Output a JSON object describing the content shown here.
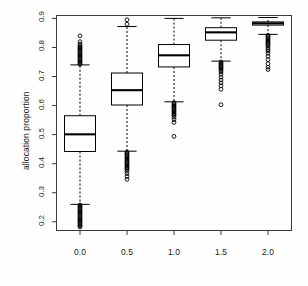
{
  "chart_data": {
    "type": "box",
    "title": "",
    "xlabel": "",
    "ylabel": "allocation proportion",
    "grid": false,
    "legend": null,
    "xlim": [
      -0.25,
      2.25
    ],
    "ylim": [
      0.17,
      0.91
    ],
    "x_tick_labels": [
      "0.0",
      "0.5",
      "1.0",
      "1.5",
      "2.0"
    ],
    "x_tick_values": [
      0.0,
      0.5,
      1.0,
      1.5,
      2.0
    ],
    "y_tick_labels": [
      "0.2",
      "0.3",
      "0.4",
      "0.5",
      "0.6",
      "0.7",
      "0.8",
      "0.9"
    ],
    "y_tick_values": [
      0.2,
      0.3,
      0.4,
      0.5,
      0.6,
      0.7,
      0.8,
      0.9
    ],
    "categories": [
      "0.0",
      "0.5",
      "1.0",
      "1.5",
      "2.0"
    ],
    "boxes": [
      {
        "category": "0.0",
        "x": 0.0,
        "q1": 0.442,
        "median": 0.501,
        "q3": 0.565,
        "whisker_low": 0.26,
        "whisker_high": 0.74,
        "outliers_low": [
          0.258,
          0.254,
          0.25,
          0.246,
          0.242,
          0.238,
          0.234,
          0.23,
          0.226,
          0.222,
          0.218,
          0.214,
          0.21,
          0.206,
          0.202,
          0.198,
          0.194,
          0.19,
          0.186,
          0.182
        ],
        "outliers_high": [
          0.742,
          0.746,
          0.75,
          0.754,
          0.758,
          0.762,
          0.766,
          0.77,
          0.774,
          0.778,
          0.782,
          0.786,
          0.79,
          0.794,
          0.798,
          0.802,
          0.806,
          0.812,
          0.82,
          0.84
        ]
      },
      {
        "category": "0.5",
        "x": 0.5,
        "q1": 0.602,
        "median": 0.653,
        "q3": 0.712,
        "whisker_low": 0.443,
        "whisker_high": 0.872,
        "outliers_low": [
          0.44,
          0.436,
          0.432,
          0.428,
          0.424,
          0.42,
          0.416,
          0.412,
          0.408,
          0.404,
          0.4,
          0.396,
          0.392,
          0.388,
          0.384,
          0.38,
          0.374,
          0.366,
          0.356,
          0.346
        ],
        "outliers_high": [
          0.88,
          0.895
        ]
      },
      {
        "category": "1.0",
        "x": 1.0,
        "q1": 0.733,
        "median": 0.773,
        "q3": 0.81,
        "whisker_low": 0.613,
        "whisker_high": 0.9,
        "outliers_low": [
          0.61,
          0.606,
          0.602,
          0.598,
          0.594,
          0.59,
          0.586,
          0.582,
          0.578,
          0.574,
          0.57,
          0.566,
          0.56,
          0.552,
          0.542,
          0.494
        ],
        "outliers_high": []
      },
      {
        "category": "1.5",
        "x": 1.5,
        "q1": 0.825,
        "median": 0.852,
        "q3": 0.868,
        "whisker_low": 0.753,
        "whisker_high": 0.902,
        "outliers_low": [
          0.75,
          0.746,
          0.742,
          0.738,
          0.734,
          0.73,
          0.726,
          0.722,
          0.716,
          0.708,
          0.698,
          0.688,
          0.678,
          0.668,
          0.656,
          0.603
        ],
        "outliers_high": []
      },
      {
        "category": "2.0",
        "x": 2.0,
        "q1": 0.877,
        "median": 0.883,
        "q3": 0.888,
        "whisker_low": 0.845,
        "whisker_high": 0.903,
        "outliers_low": [
          0.842,
          0.838,
          0.834,
          0.83,
          0.826,
          0.822,
          0.818,
          0.814,
          0.81,
          0.806,
          0.8,
          0.794,
          0.788,
          0.78,
          0.77,
          0.758,
          0.744,
          0.732,
          0.724
        ],
        "outliers_high": []
      }
    ],
    "style": {
      "line_color": "#000000",
      "box_fill": "#ffffff",
      "whisker_dash": "dashed",
      "outlier_marker": "open-circle",
      "background": "#ffffff"
    }
  }
}
